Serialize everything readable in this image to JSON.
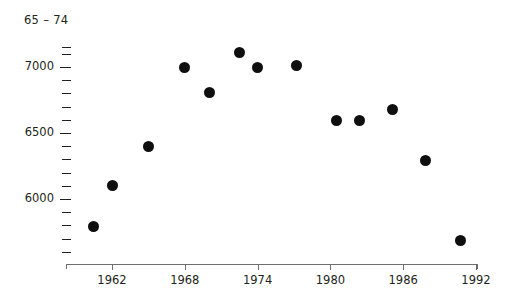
{
  "chart_data": {
    "type": "scatter",
    "title": "65 – 74",
    "xlabel": "",
    "ylabel": "",
    "xlim": [
      1959,
      1993
    ],
    "ylim": [
      5600,
      7200
    ],
    "grid": false,
    "legend": null,
    "marker": "filled-circle",
    "marker_color": "#0f0f0f",
    "x_ticks": [
      1962,
      1968,
      1974,
      1980,
      1986,
      1992
    ],
    "x_tick_labels": [
      "1962",
      "1968",
      "1974",
      "1980",
      "1986",
      "1992"
    ],
    "y_ticks_labeled": [
      7000,
      6500,
      6000
    ],
    "y_tick_labels": [
      "7000",
      "6500",
      "6000"
    ],
    "y_ticks_minor": [
      7150,
      7100,
      6900,
      6800,
      6700,
      6600,
      6400,
      6300,
      6200,
      6100,
      5900,
      5800,
      5700,
      5600
    ],
    "x": [
      1960.5,
      1962.0,
      1965.0,
      1968.0,
      1970.0,
      1972.5,
      1974.0,
      1977.2,
      1980.5,
      1982.4,
      1985.1,
      1987.8,
      1990.7
    ],
    "values": [
      5790,
      6100,
      6400,
      7000,
      6810,
      7110,
      7000,
      7010,
      6595,
      6595,
      6680,
      6290,
      5685
    ],
    "points": [
      {
        "x": 1960.5,
        "y": 5790
      },
      {
        "x": 1962.0,
        "y": 6100
      },
      {
        "x": 1965.0,
        "y": 6400
      },
      {
        "x": 1968.0,
        "y": 7000
      },
      {
        "x": 1970.0,
        "y": 6810
      },
      {
        "x": 1972.5,
        "y": 7110
      },
      {
        "x": 1974.0,
        "y": 7000
      },
      {
        "x": 1977.2,
        "y": 7010
      },
      {
        "x": 1980.5,
        "y": 6595
      },
      {
        "x": 1982.4,
        "y": 6595
      },
      {
        "x": 1985.1,
        "y": 6680
      },
      {
        "x": 1987.8,
        "y": 6290
      },
      {
        "x": 1990.7,
        "y": 5685
      }
    ]
  },
  "axis_color": "#6d6e70",
  "text_color": "#231f20"
}
